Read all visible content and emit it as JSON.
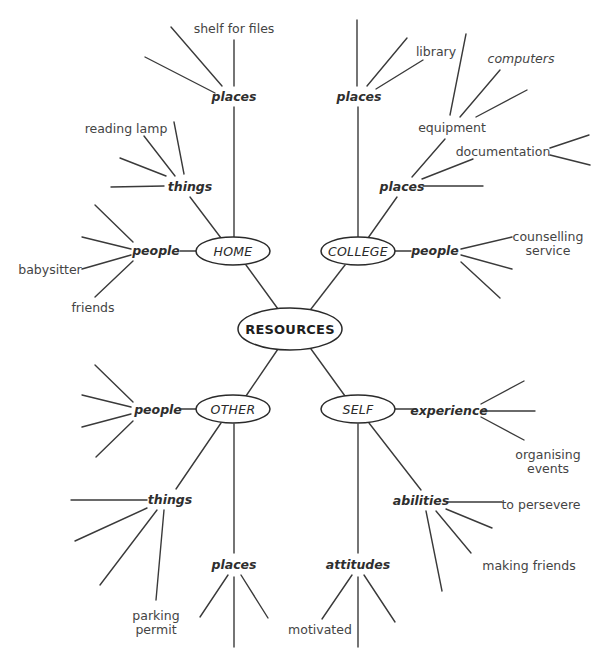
{
  "diagram": {
    "type": "mind-map",
    "center": {
      "label": "RESOURCES",
      "cx": 290,
      "cy": 329,
      "rx": 52,
      "ry": 21
    },
    "branches": [
      {
        "id": "home",
        "label": "HOME",
        "cx": 233,
        "cy": 251,
        "rx": 37,
        "ry": 14
      },
      {
        "id": "college",
        "label": "COLLEGE",
        "cx": 358,
        "cy": 251,
        "rx": 37,
        "ry": 14
      },
      {
        "id": "other",
        "label": "OTHER",
        "cx": 233,
        "cy": 409,
        "rx": 37,
        "ry": 14
      },
      {
        "id": "self",
        "label": "SELF",
        "cx": 358,
        "cy": 409,
        "rx": 37,
        "ry": 14
      }
    ],
    "categories": [
      {
        "id": "home-places",
        "label": "places",
        "x": 234,
        "y": 101,
        "anchor": "middle"
      },
      {
        "id": "home-things",
        "label": "things",
        "x": 190,
        "y": 191,
        "anchor": "middle"
      },
      {
        "id": "home-people",
        "label": "people",
        "x": 156,
        "y": 255,
        "anchor": "middle"
      },
      {
        "id": "college-places1",
        "label": "places",
        "x": 359,
        "y": 101,
        "anchor": "middle"
      },
      {
        "id": "college-places2",
        "label": "places",
        "x": 402,
        "y": 191,
        "anchor": "middle"
      },
      {
        "id": "college-people",
        "label": "people",
        "x": 435,
        "y": 255,
        "anchor": "middle"
      },
      {
        "id": "other-people",
        "label": "people",
        "x": 158,
        "y": 414,
        "anchor": "middle"
      },
      {
        "id": "other-things",
        "label": "things",
        "x": 170,
        "y": 504,
        "anchor": "middle"
      },
      {
        "id": "other-places",
        "label": "places",
        "x": 234,
        "y": 569,
        "anchor": "middle"
      },
      {
        "id": "self-experience",
        "label": "experience",
        "x": 449,
        "y": 415,
        "anchor": "middle"
      },
      {
        "id": "self-abilities",
        "label": "abilities",
        "x": 421,
        "y": 505,
        "anchor": "middle"
      },
      {
        "id": "self-attitudes",
        "label": "attitudes",
        "x": 358,
        "y": 569,
        "anchor": "middle"
      }
    ],
    "leaves": [
      {
        "id": "shelf-for-files",
        "label": "shelf for files",
        "x": 234,
        "y": 33,
        "anchor": "middle",
        "italic": false
      },
      {
        "id": "reading-lamp",
        "label": "reading lamp",
        "x": 126,
        "y": 133,
        "anchor": "middle",
        "italic": false
      },
      {
        "id": "babysitter",
        "label": "babysitter",
        "x": 50,
        "y": 274,
        "anchor": "middle",
        "italic": false
      },
      {
        "id": "friends",
        "label": "friends",
        "x": 93,
        "y": 312,
        "anchor": "middle",
        "italic": false
      },
      {
        "id": "library",
        "label": "library",
        "x": 436,
        "y": 56,
        "anchor": "middle",
        "italic": false
      },
      {
        "id": "computers",
        "label": "computers",
        "x": 521,
        "y": 63,
        "anchor": "middle",
        "italic": true
      },
      {
        "id": "equipment",
        "label": "equipment",
        "x": 452,
        "y": 132,
        "anchor": "middle",
        "italic": false
      },
      {
        "id": "documentation",
        "label": "documentation",
        "x": 503,
        "y": 156,
        "anchor": "middle",
        "italic": false
      },
      {
        "id": "counselling-service-1",
        "label": "counselling",
        "x": 548,
        "y": 241,
        "anchor": "middle",
        "italic": false
      },
      {
        "id": "counselling-service-2",
        "label": "service",
        "x": 548,
        "y": 255,
        "anchor": "middle",
        "italic": false
      },
      {
        "id": "organising-events-1",
        "label": "organising",
        "x": 548,
        "y": 459,
        "anchor": "middle",
        "italic": false
      },
      {
        "id": "organising-events-2",
        "label": "events",
        "x": 548,
        "y": 473,
        "anchor": "middle",
        "italic": false
      },
      {
        "id": "to-persevere",
        "label": "to persevere",
        "x": 541,
        "y": 509,
        "anchor": "middle",
        "italic": false
      },
      {
        "id": "making-friends",
        "label": "making friends",
        "x": 529,
        "y": 570,
        "anchor": "middle",
        "italic": false
      },
      {
        "id": "parking-permit-1",
        "label": "parking",
        "x": 156,
        "y": 620,
        "anchor": "middle",
        "italic": false
      },
      {
        "id": "parking-permit-2",
        "label": "permit",
        "x": 156,
        "y": 634,
        "anchor": "middle",
        "italic": false
      },
      {
        "id": "motivated",
        "label": "motivated",
        "x": 320,
        "y": 634,
        "anchor": "middle",
        "italic": false
      }
    ],
    "edges": [
      {
        "from": "resources",
        "to": "home",
        "x1": 278,
        "y1": 309,
        "x2": 246,
        "y2": 265
      },
      {
        "from": "resources",
        "to": "college",
        "x1": 311,
        "y1": 309,
        "x2": 345,
        "y2": 265
      },
      {
        "from": "resources",
        "to": "other",
        "x1": 278,
        "y1": 349,
        "x2": 246,
        "y2": 396
      },
      {
        "from": "resources",
        "to": "self",
        "x1": 311,
        "y1": 349,
        "x2": 345,
        "y2": 396
      },
      {
        "from": "home",
        "to": "home-places",
        "x1": 234,
        "y1": 237,
        "x2": 234,
        "y2": 107
      },
      {
        "from": "home-places",
        "to": "shelf-for-files",
        "x1": 234,
        "y1": 86,
        "x2": 234,
        "y2": 40
      },
      {
        "from": "home-places",
        "to": "spoke",
        "x1": 222,
        "y1": 86,
        "x2": 171,
        "y2": 27
      },
      {
        "from": "home-places",
        "to": "spoke",
        "x1": 215,
        "y1": 93,
        "x2": 145,
        "y2": 57
      },
      {
        "from": "home",
        "to": "home-things",
        "x1": 221,
        "y1": 238,
        "x2": 190,
        "y2": 197
      },
      {
        "from": "home-things",
        "to": "reading-lamp",
        "x1": 175,
        "y1": 176,
        "x2": 144,
        "y2": 136
      },
      {
        "from": "home-things",
        "to": "spoke",
        "x1": 184,
        "y1": 174,
        "x2": 174,
        "y2": 122
      },
      {
        "from": "home-things",
        "to": "spoke",
        "x1": 166,
        "y1": 176,
        "x2": 120,
        "y2": 158
      },
      {
        "from": "home-things",
        "to": "spoke",
        "x1": 164,
        "y1": 186,
        "x2": 111,
        "y2": 187
      },
      {
        "from": "home",
        "to": "home-people",
        "x1": 196,
        "y1": 251,
        "x2": 180,
        "y2": 251
      },
      {
        "from": "home-people",
        "to": "spoke",
        "x1": 133,
        "y1": 242,
        "x2": 95,
        "y2": 205
      },
      {
        "from": "home-people",
        "to": "spoke",
        "x1": 131,
        "y1": 249,
        "x2": 82,
        "y2": 237
      },
      {
        "from": "home-people",
        "to": "babysitter",
        "x1": 131,
        "y1": 255,
        "x2": 82,
        "y2": 269
      },
      {
        "from": "home-people",
        "to": "friends",
        "x1": 133,
        "y1": 261,
        "x2": 95,
        "y2": 297
      },
      {
        "from": "college",
        "to": "college-places1",
        "x1": 358,
        "y1": 237,
        "x2": 358,
        "y2": 107
      },
      {
        "from": "college-places1",
        "to": "spoke",
        "x1": 357,
        "y1": 86,
        "x2": 357,
        "y2": 20
      },
      {
        "from": "college-places1",
        "to": "spoke",
        "x1": 367,
        "y1": 86,
        "x2": 407,
        "y2": 38
      },
      {
        "from": "college-places1",
        "to": "library",
        "x1": 376,
        "y1": 89,
        "x2": 423,
        "y2": 60
      },
      {
        "from": "college",
        "to": "college-places2",
        "x1": 368,
        "y1": 238,
        "x2": 397,
        "y2": 197
      },
      {
        "from": "college-places2",
        "to": "equipment",
        "x1": 412,
        "y1": 177,
        "x2": 445,
        "y2": 139
      },
      {
        "from": "college-places2",
        "to": "documentation",
        "x1": 422,
        "y1": 179,
        "x2": 473,
        "y2": 159
      },
      {
        "from": "college-places2",
        "to": "spoke",
        "x1": 423,
        "y1": 186,
        "x2": 483,
        "y2": 186
      },
      {
        "from": "equipment",
        "to": "spoke",
        "x1": 450,
        "y1": 115,
        "x2": 466,
        "y2": 34
      },
      {
        "from": "equipment",
        "to": "computers",
        "x1": 460,
        "y1": 117,
        "x2": 500,
        "y2": 70
      },
      {
        "from": "equipment",
        "to": "spoke",
        "x1": 476,
        "y1": 117,
        "x2": 527,
        "y2": 90
      },
      {
        "from": "documentation",
        "to": "spoke",
        "x1": 550,
        "y1": 148,
        "x2": 589,
        "y2": 135
      },
      {
        "from": "documentation",
        "to": "spoke",
        "x1": 550,
        "y1": 155,
        "x2": 590,
        "y2": 165
      },
      {
        "from": "college",
        "to": "college-people",
        "x1": 395,
        "y1": 251,
        "x2": 411,
        "y2": 251
      },
      {
        "from": "college-people",
        "to": "counselling-service",
        "x1": 461,
        "y1": 249,
        "x2": 512,
        "y2": 237
      },
      {
        "from": "college-people",
        "to": "spoke",
        "x1": 461,
        "y1": 255,
        "x2": 512,
        "y2": 269
      },
      {
        "from": "college-people",
        "to": "spoke",
        "x1": 461,
        "y1": 262,
        "x2": 500,
        "y2": 298
      },
      {
        "from": "other",
        "to": "other-people",
        "x1": 196,
        "y1": 409,
        "x2": 180,
        "y2": 409
      },
      {
        "from": "other-people",
        "to": "spoke",
        "x1": 133,
        "y1": 402,
        "x2": 95,
        "y2": 365
      },
      {
        "from": "other-people",
        "to": "spoke",
        "x1": 131,
        "y1": 407,
        "x2": 82,
        "y2": 395
      },
      {
        "from": "other-people",
        "to": "spoke",
        "x1": 131,
        "y1": 414,
        "x2": 82,
        "y2": 427
      },
      {
        "from": "other-people",
        "to": "spoke",
        "x1": 133,
        "y1": 421,
        "x2": 96,
        "y2": 457
      },
      {
        "from": "other",
        "to": "other-things",
        "x1": 221,
        "y1": 423,
        "x2": 176,
        "y2": 489
      },
      {
        "from": "other",
        "to": "other-places",
        "x1": 234,
        "y1": 424,
        "x2": 234,
        "y2": 553
      },
      {
        "from": "other-things",
        "to": "spoke",
        "x1": 147,
        "y1": 500,
        "x2": 71,
        "y2": 500
      },
      {
        "from": "other-things",
        "to": "spoke",
        "x1": 147,
        "y1": 508,
        "x2": 75,
        "y2": 541
      },
      {
        "from": "other-things",
        "to": "spoke",
        "x1": 157,
        "y1": 510,
        "x2": 100,
        "y2": 585
      },
      {
        "from": "other-things",
        "to": "parking-permit",
        "x1": 164,
        "y1": 510,
        "x2": 156,
        "y2": 600
      },
      {
        "from": "other-places",
        "to": "spoke",
        "x1": 228,
        "y1": 575,
        "x2": 200,
        "y2": 617
      },
      {
        "from": "other-places",
        "to": "spoke",
        "x1": 234,
        "y1": 577,
        "x2": 234,
        "y2": 647
      },
      {
        "from": "other-places",
        "to": "spoke",
        "x1": 241,
        "y1": 575,
        "x2": 268,
        "y2": 618
      },
      {
        "from": "self",
        "to": "self-experience",
        "x1": 395,
        "y1": 409,
        "x2": 416,
        "y2": 409
      },
      {
        "from": "self-experience",
        "to": "spoke",
        "x1": 481,
        "y1": 404,
        "x2": 524,
        "y2": 381
      },
      {
        "from": "self-experience",
        "to": "spoke",
        "x1": 481,
        "y1": 411,
        "x2": 535,
        "y2": 411
      },
      {
        "from": "self-experience",
        "to": "organising-events",
        "x1": 481,
        "y1": 417,
        "x2": 524,
        "y2": 440
      },
      {
        "from": "self",
        "to": "self-abilities",
        "x1": 369,
        "y1": 423,
        "x2": 421,
        "y2": 490
      },
      {
        "from": "self-abilities",
        "to": "to-persevere",
        "x1": 447,
        "y1": 502,
        "x2": 502,
        "y2": 502
      },
      {
        "from": "self-abilities",
        "to": "spoke",
        "x1": 446,
        "y1": 509,
        "x2": 492,
        "y2": 528
      },
      {
        "from": "self-abilities",
        "to": "spoke",
        "x1": 436,
        "y1": 511,
        "x2": 471,
        "y2": 553
      },
      {
        "from": "self-abilities",
        "to": "spoke",
        "x1": 426,
        "y1": 511,
        "x2": 442,
        "y2": 591
      },
      {
        "from": "self",
        "to": "self-attitudes",
        "x1": 358,
        "y1": 424,
        "x2": 358,
        "y2": 553
      },
      {
        "from": "self-attitudes",
        "to": "motivated",
        "x1": 352,
        "y1": 575,
        "x2": 322,
        "y2": 619
      },
      {
        "from": "self-attitudes",
        "to": "spoke",
        "x1": 358,
        "y1": 577,
        "x2": 358,
        "y2": 647
      },
      {
        "from": "self-attitudes",
        "to": "spoke",
        "x1": 364,
        "y1": 575,
        "x2": 395,
        "y2": 622
      }
    ]
  },
  "labels": {
    "center": "RESOURCES",
    "home": "HOME",
    "college": "COLLEGE",
    "other": "OTHER",
    "self": "SELF"
  }
}
